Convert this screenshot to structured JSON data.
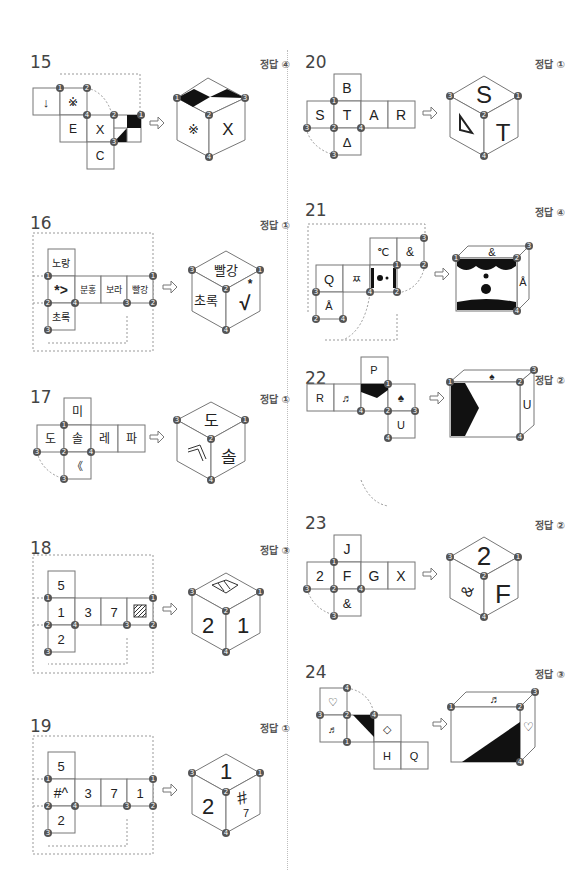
{
  "divider": "vertical-dotted",
  "answer_prefix": "정답",
  "problems": [
    {
      "number": "15",
      "answer": "정답 ④",
      "net": {
        "cells": [
          "↓",
          "※",
          "E",
          "X",
          "C",
          "diagonal-checker"
        ]
      },
      "cube": {
        "top": "checker-pattern",
        "left": "※",
        "right": "X"
      }
    },
    {
      "number": "16",
      "answer": "정답 ①",
      "net": {
        "cells": [
          "노랑",
          "*>",
          "분홍",
          "보라",
          "빨강",
          "초록"
        ]
      },
      "cube": {
        "top": "빨강",
        "left": "초록",
        "right": "*√"
      }
    },
    {
      "number": "17",
      "answer": "정답 ①",
      "net": {
        "cells": [
          "미",
          "도",
          "솔",
          "레",
          "파",
          "《"
        ]
      },
      "cube": {
        "top": "도",
        "left": "⟨⟨ rotated",
        "right": "솔"
      }
    },
    {
      "number": "18",
      "answer": "정답 ③",
      "net": {
        "cells": [
          "5",
          "1",
          "3",
          "7",
          "hatched-square",
          "2"
        ]
      },
      "cube": {
        "top": "hatched-square",
        "left": "2",
        "right": "1"
      }
    },
    {
      "number": "19",
      "answer": "정답 ①",
      "net": {
        "cells": [
          "5",
          "#^",
          "3",
          "7",
          "1",
          "2"
        ]
      },
      "cube": {
        "top": "1",
        "left": "2",
        "right": "#^ rotated"
      }
    },
    {
      "number": "20",
      "answer": "정답 ①",
      "net": {
        "cells": [
          "B",
          "S",
          "T",
          "A",
          "R",
          "Δ"
        ]
      },
      "cube": {
        "top": "S",
        "left": "Δ rotated",
        "right": "T"
      }
    },
    {
      "number": "21",
      "answer": "정답 ④",
      "net": {
        "cells": [
          "℃",
          "&",
          "Q",
          "ㅉ",
          "face",
          "Å"
        ]
      },
      "cube": {
        "top": "&",
        "front": "face",
        "right": "Å"
      }
    },
    {
      "number": "22",
      "answer": "정답 ②",
      "net": {
        "cells": [
          "P",
          "R",
          "♬",
          "black-pentagon",
          "♠",
          "U"
        ]
      },
      "cube": {
        "top": "♠",
        "front": "black-pentagon",
        "right": "U"
      }
    },
    {
      "number": "23",
      "answer": "정답 ②",
      "net": {
        "cells": [
          "J",
          "2",
          "F",
          "G",
          "X",
          "&"
        ]
      },
      "cube": {
        "top": "2",
        "left": "& rotated",
        "right": "F"
      }
    },
    {
      "number": "24",
      "answer": "정답 ③",
      "net": {
        "cells": [
          "♡",
          "♬",
          "black-triangle",
          "◇",
          "H",
          "Q"
        ]
      },
      "cube": {
        "top": "♬",
        "front": "black-triangle",
        "right": "♡"
      }
    }
  ],
  "labels": {
    "p15": {
      "a": "↓",
      "b": "※",
      "c": "E",
      "d": "X",
      "e": "C",
      "ca": "※",
      "cb": "X"
    },
    "p16": {
      "a": "노랑",
      "b": "*>",
      "c": "분홍",
      "d": "보라",
      "e": "빨강",
      "f": "초록",
      "ca": "빨강",
      "cb": "초록",
      "cc": "√"
    },
    "p17": {
      "a": "미",
      "b": "도",
      "c": "솔",
      "d": "레",
      "e": "파",
      "f": "《",
      "ca": "도",
      "cb": "솔"
    },
    "p18": {
      "a": "5",
      "b": "1",
      "c": "3",
      "d": "7",
      "f": "2",
      "cb": "2",
      "cc": "1"
    },
    "p19": {
      "a": "5",
      "b": "#^",
      "c": "3",
      "d": "7",
      "e": "1",
      "f": "2",
      "ca": "1",
      "cb": "2",
      "cc": "#"
    },
    "p20": {
      "a": "B",
      "b": "S",
      "c": "T",
      "d": "A",
      "e": "R",
      "f": "Δ",
      "ca": "S",
      "cc": "T"
    },
    "p21": {
      "a": "℃",
      "b": "&",
      "c": "Q",
      "d": "ㅉ",
      "f": "Å",
      "ca": "&",
      "cc": "Å"
    },
    "p22": {
      "a": "P",
      "b": "R",
      "c": "♬",
      "e": "♠",
      "f": "U",
      "ca": "♠",
      "cc": "U"
    },
    "p23": {
      "a": "J",
      "b": "2",
      "c": "F",
      "d": "G",
      "e": "X",
      "f": "&",
      "ca": "2",
      "cb": "&",
      "cc": "F"
    },
    "p24": {
      "a": "♡",
      "b": "♬",
      "d": "◇",
      "e": "H",
      "f": "Q",
      "ca": "♬",
      "cc": "♡"
    }
  }
}
